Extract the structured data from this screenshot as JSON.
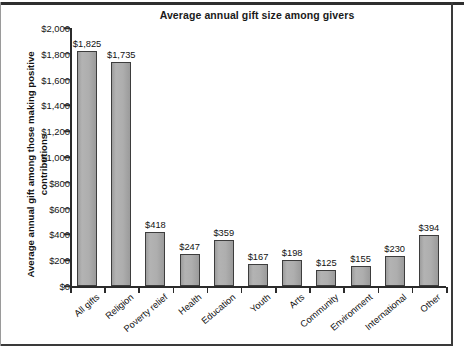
{
  "chart_data": {
    "type": "bar",
    "title": "Average annual gift size among givers",
    "xlabel": "",
    "ylabel": "Average annual gift among those making positive contributions",
    "ylim": [
      0,
      2000
    ],
    "ytick_step": 200,
    "grid": false,
    "legend": "none",
    "value_prefix": "$",
    "categories": [
      "All gifts",
      "Religion",
      "Poverty relief",
      "Health",
      "Education",
      "Youth",
      "Arts",
      "Community",
      "Environment",
      "International",
      "Other"
    ],
    "values": [
      1825,
      1735,
      418,
      247,
      359,
      167,
      198,
      125,
      155,
      230,
      394
    ],
    "value_labels": [
      "$1,825",
      "$1,735",
      "$418",
      "$247",
      "$359",
      "$167",
      "$198",
      "$125",
      "$155",
      "$230",
      "$394"
    ],
    "ytick_labels": [
      "$0",
      "$200",
      "$400",
      "$600",
      "$800",
      "$1,000",
      "$1,200",
      "$1,400",
      "$1,600",
      "$1,800",
      "$2,000"
    ],
    "ytick_values": [
      0,
      200,
      400,
      600,
      800,
      1000,
      1200,
      1400,
      1600,
      1800,
      2000
    ],
    "bar_color": "#a9a9a9",
    "bar_edge_color": "#3d3d3d",
    "axis_color": "#2b2b2b",
    "background_color": "#ffffff"
  }
}
